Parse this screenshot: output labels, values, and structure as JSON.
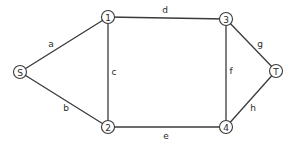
{
  "graph": {
    "nodes": [
      {
        "id": "S",
        "label": "S",
        "x": 20,
        "y": 72
      },
      {
        "id": "1",
        "label": "1",
        "x": 108,
        "y": 17
      },
      {
        "id": "2",
        "label": "2",
        "x": 108,
        "y": 127
      },
      {
        "id": "3",
        "label": "3",
        "x": 226,
        "y": 19
      },
      {
        "id": "4",
        "label": "4",
        "x": 226,
        "y": 127
      },
      {
        "id": "T",
        "label": "T",
        "x": 276,
        "y": 71
      }
    ],
    "edges": [
      {
        "id": "a",
        "label": "a",
        "from": "S",
        "to": "1",
        "lx": 51,
        "ly": 44
      },
      {
        "id": "b",
        "label": "b",
        "from": "S",
        "to": "2",
        "lx": 66,
        "ly": 108
      },
      {
        "id": "c",
        "label": "c",
        "from": "1",
        "to": "2",
        "lx": 114,
        "ly": 72
      },
      {
        "id": "d",
        "label": "d",
        "from": "1",
        "to": "3",
        "lx": 165,
        "ly": 10
      },
      {
        "id": "e",
        "label": "e",
        "from": "2",
        "to": "4",
        "lx": 166,
        "ly": 136
      },
      {
        "id": "f",
        "label": "f",
        "from": "3",
        "to": "4",
        "lx": 231,
        "ly": 71
      },
      {
        "id": "g",
        "label": "g",
        "from": "3",
        "to": "T",
        "lx": 260,
        "ly": 44
      },
      {
        "id": "h",
        "label": "h",
        "from": "4",
        "to": "T",
        "lx": 253,
        "ly": 108
      }
    ]
  }
}
